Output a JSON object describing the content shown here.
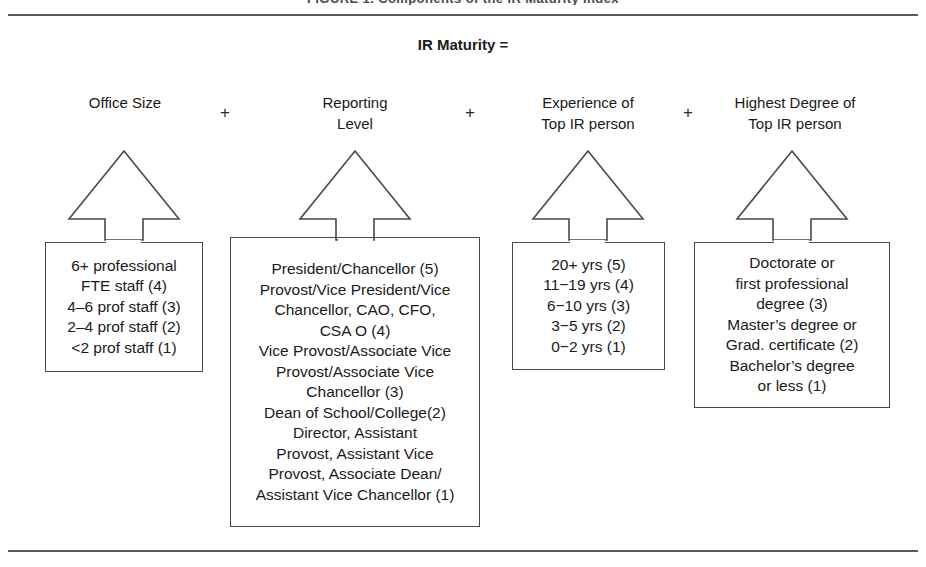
{
  "figure": {
    "caption_sliver": "FIGURE 1.  Components of the IR Maturity Index",
    "title": "IR Maturity =",
    "operator": "+",
    "arrow_icon": "up-arrow-icon"
  },
  "columns": [
    {
      "id": "office-size",
      "header": "Office Size",
      "box_text": "6+ professional\nFTE staff (4)\n4–6 prof staff (3)\n2–4 prof staff (2)\n<2 prof staff (1)"
    },
    {
      "id": "reporting-level",
      "header": "Reporting\nLevel",
      "box_text": "President/Chancellor (5)\nProvost/Vice President/Vice\nChancellor, CAO, CFO,\nCSA O (4)\nVice Provost/Associate Vice\nProvost/Associate Vice\nChancellor (3)\nDean of School/College(2)\nDirector, Assistant\nProvost, Assistant Vice\nProvost, Associate Dean/\nAssistant Vice Chancellor (1)"
    },
    {
      "id": "experience",
      "header": "Experience of\nTop IR person",
      "box_text": "20+ yrs (5)\n11−19 yrs (4)\n6−10 yrs (3)\n3−5 yrs (2)\n0−2 yrs (1)"
    },
    {
      "id": "highest-degree",
      "header": "Highest Degree of\nTop IR person",
      "box_text": "Doctorate or\nfirst professional\ndegree (3)\nMaster’s degree or\nGrad. certificate (2)\nBachelor’s degree\nor less (1)"
    }
  ],
  "colors": {
    "ink": "#1a1a1a",
    "line": "#4a4a4a",
    "rule": "#5b5b5b",
    "background": "#ffffff"
  }
}
